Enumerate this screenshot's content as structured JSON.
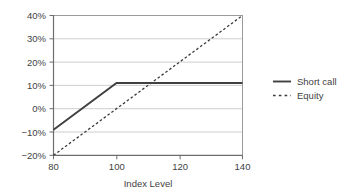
{
  "chart_data": {
    "type": "line",
    "title": "",
    "subtitle": "",
    "xlabel": "Index Level",
    "ylabel": "",
    "xlim": [
      80,
      140
    ],
    "ylim": [
      -20,
      40
    ],
    "xticks": [
      80,
      100,
      120,
      140
    ],
    "xtick_labels": [
      "80",
      "100",
      "120",
      "140"
    ],
    "yticks": [
      -20,
      -10,
      0,
      10,
      20,
      30,
      40
    ],
    "ytick_labels": [
      "−20%",
      "−10%",
      "0%",
      "10%",
      "20%",
      "30%",
      "40%"
    ],
    "grid": "horizontal",
    "legend_position": "right",
    "series": [
      {
        "name": "Short call",
        "style": "solid",
        "color": "#404040",
        "x": [
          80,
          100,
          140
        ],
        "values": [
          -9,
          11,
          11
        ]
      },
      {
        "name": "Equity",
        "style": "dashed",
        "color": "#3a3a3a",
        "x": [
          80,
          140
        ],
        "values": [
          -20,
          40
        ]
      }
    ],
    "annotations": []
  },
  "legend": {
    "items": [
      {
        "label": "Short call",
        "style": "solid"
      },
      {
        "label": "Equity",
        "style": "dashed"
      }
    ]
  },
  "axis": {
    "x_title": "Index Level",
    "x_tick_labels": [
      "80",
      "100",
      "120",
      "140"
    ],
    "y_tick_labels": [
      "40%",
      "30%",
      "20%",
      "10%",
      "0%",
      "−10%",
      "−20%"
    ]
  }
}
